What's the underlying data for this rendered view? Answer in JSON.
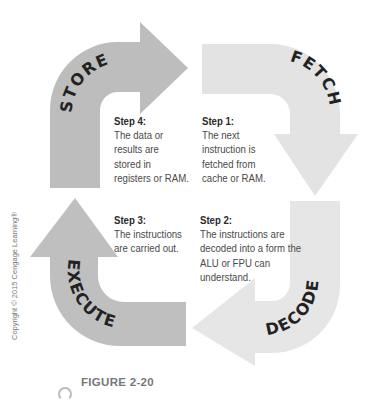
{
  "diagram": {
    "type": "cycle",
    "stages": [
      {
        "name": "FETCH",
        "step_title": "Step 1:",
        "step_text": "The next\ninstruction is\nfetched from\ncache or RAM."
      },
      {
        "name": "DECODE",
        "step_title": "Step 2:",
        "step_text": "The instructions are\ndecoded into a form the\nALU or FPU can\nunderstand."
      },
      {
        "name": "EXECUTE",
        "step_title": "Step 3:",
        "step_text": "The instructions\nare carried out."
      },
      {
        "name": "STORE",
        "step_title": "Step 4:",
        "step_text": "The data or\nresults are\nstored in\nregisters or RAM."
      }
    ],
    "colors": {
      "store": "#bdbdbd",
      "fetch": "#e3e3e3",
      "decode": "#e6e6e6",
      "execute": "#bfbfbf",
      "label_text": "#222222"
    }
  },
  "copyright": "Copyright © 2015 Cengage Learning®",
  "figure_label": "FIGURE 2-20"
}
